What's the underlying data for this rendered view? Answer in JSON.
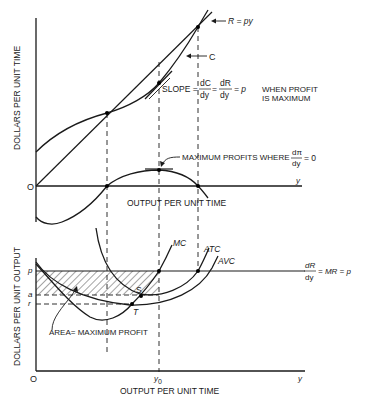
{
  "top_panel": {
    "y_axis_label": "DOLLARS PER UNIT TIME",
    "x_axis_label": "OUTPUT PER UNIT TIME",
    "origin_label": "O",
    "x_axis_end_label": "y",
    "revenue_label": "R = py",
    "cost_label": "C",
    "slope_annotation": {
      "prefix": "SLOPE =",
      "frac1_num": "dC",
      "frac1_den": "dy",
      "eq": "=",
      "frac2_num": "dR",
      "frac2_den": "dy",
      "suffix": "= p",
      "note_line1": "WHEN PROFIT",
      "note_line2": "IS MAXIMUM"
    },
    "max_profit_annotation": {
      "text": "MAXIMUM PROFITS WHERE",
      "frac_num": "dπ",
      "frac_den": "dy",
      "suffix": "= 0"
    }
  },
  "bottom_panel": {
    "y_axis_label": "DOLLARS PER UNIT OUTPUT",
    "x_axis_label": "OUTPUT PER UNIT TIME",
    "origin_label": "O",
    "x_axis_end_label": "y",
    "y0_label": "y",
    "y0_sub": "0",
    "price_label": "p",
    "a_label": "a",
    "r_label": "r",
    "mc_label": "MC",
    "atc_label": "ATC",
    "avc_label": "AVC",
    "s_label": "S",
    "t_label": "T",
    "area_label": "AREA= MAXIMUM PROFIT",
    "mr_annotation": {
      "frac_num": "dR",
      "frac_den": "dy",
      "suffix": "= MR = p"
    }
  },
  "colors": {
    "ink": "#1a1a1a",
    "background": "#ffffff"
  }
}
